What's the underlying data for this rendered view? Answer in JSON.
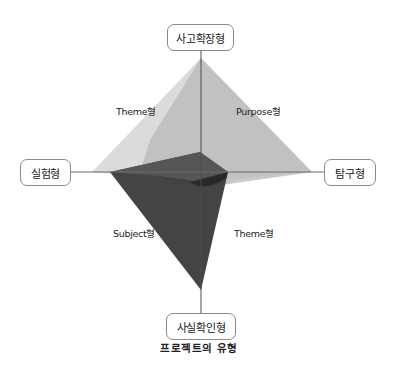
{
  "diagram": {
    "caption": "프로젝트의 유형",
    "axes": {
      "top": "사고확장형",
      "left": "실험형",
      "right": "탐구형",
      "bottom": "사실확인형"
    },
    "regions": {
      "upper_left": "Theme형",
      "upper_right": "Purpose형",
      "lower_left": "Subject형",
      "lower_right": "Theme형"
    },
    "colors": {
      "axis_line": "#555555",
      "box_border": "#8a8a8a",
      "theme_polygon": "#d6d6d6",
      "purpose_polygon": "#bdbdbd",
      "subject_polygon": "#3a3a3a",
      "inner_polygon": "#555555"
    }
  }
}
